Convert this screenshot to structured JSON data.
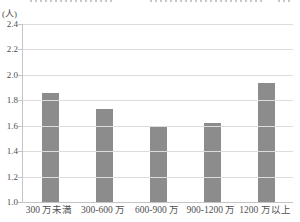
{
  "chart_data": {
    "type": "bar",
    "unit_label": "(人)",
    "categories": [
      "300 万未満",
      "300-600 万",
      "600-900 万",
      "900-1200 万",
      "1200 万以上"
    ],
    "values": [
      1.86,
      1.73,
      1.6,
      1.62,
      1.94
    ],
    "ylim": [
      1.0,
      2.4
    ],
    "yticks": [
      "2.4",
      "2.2",
      "2.0",
      "1.8",
      "1.6",
      "1.4",
      "1.2",
      "1.0"
    ],
    "grid": true,
    "legend_position": "none",
    "bar_color": "#8c8c8c",
    "gridline_color": "#dcdcdc",
    "axis_color": "#c4c4c4",
    "text_color": "#4f4f4f",
    "background_color": "#ffffff"
  }
}
